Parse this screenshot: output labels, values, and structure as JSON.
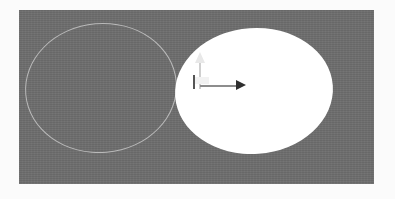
{
  "app": {
    "view_name": "3d-viewport",
    "background_color": "#6d6d6d",
    "page_background_color": "#fbfbfb"
  },
  "viewport": {
    "label": "Perspective viewport",
    "x": 19,
    "y": 10,
    "width": 355,
    "height": 174
  },
  "objects": [
    {
      "name": "wireframe-ellipse",
      "display_name": "Wireframe ellipse",
      "render_mode": "wireframe",
      "outline_color": "#b9b9b9",
      "fill": "none",
      "center_x": 101,
      "center_y": 88,
      "radius_x": 76,
      "radius_y": 65,
      "rotation_deg": -5
    },
    {
      "name": "solid-ellipsoid",
      "display_name": "Solid ellipsoid",
      "render_mode": "shaded",
      "outline_color": "none",
      "fill": "#ffffff",
      "center_x": 254,
      "center_y": 91,
      "radius_x": 79,
      "radius_y": 63,
      "rotation_deg": -4
    }
  ],
  "gizmo": {
    "name": "transform-gizmo",
    "display_name": "Move manipulator",
    "origin_x": 194,
    "origin_y": 87,
    "axes": [
      {
        "name": "y-axis",
        "label": "Y",
        "direction": "up",
        "color": "#e8e8e8",
        "length": 39
      },
      {
        "name": "x-axis",
        "label": "X",
        "direction": "right",
        "color": "#2f2f2f",
        "length": 52
      }
    ],
    "handle": {
      "name": "plane-handle",
      "label": "Plane drag handle",
      "color": "#f2f2f2"
    }
  }
}
